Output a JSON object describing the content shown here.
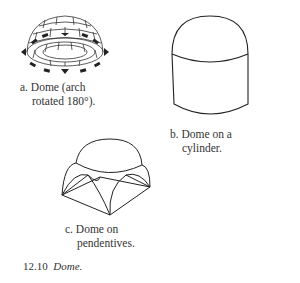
{
  "figures": [
    {
      "id": "a",
      "caption_line1": "a. Dome (arch",
      "caption_line2": "rotated 180°)."
    },
    {
      "id": "b",
      "caption_line1": "b. Dome on a",
      "caption_line2": "cylinder."
    },
    {
      "id": "c",
      "caption_line1": "c. Dome on",
      "caption_line2": "pendentives."
    }
  ],
  "figure_caption": {
    "number": "12.10",
    "title": "Dome."
  }
}
